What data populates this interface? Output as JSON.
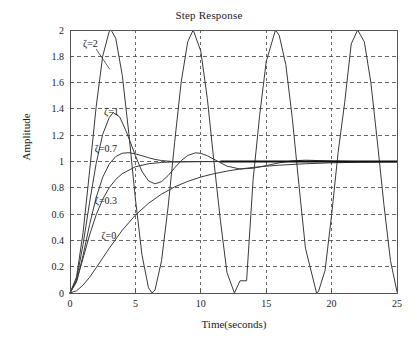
{
  "figure": {
    "title": "Step Response",
    "background_color": "#ffffff",
    "axis_color": "#555555",
    "grid_color": "#444444",
    "curve_color": "#3a3a3a"
  },
  "axes": {
    "x_label": "Time(seconds)",
    "y_label": "Amplitude",
    "x_ticks": [
      "0",
      "5",
      "10",
      "15",
      "20",
      "25"
    ],
    "y_ticks": [
      "0",
      "0.2",
      "0.4",
      "0.6",
      "0.8",
      "1",
      "1.2",
      "1.4",
      "1.6",
      "1.8",
      "2"
    ]
  },
  "annotations": [
    {
      "name": "zeta-2-label",
      "text": "ζ=2",
      "x": 1.0,
      "y": 1.9
    },
    {
      "name": "zeta-1-label",
      "text": "ζ=1",
      "x": 2.6,
      "y": 1.38
    },
    {
      "name": "zeta-0p7-label",
      "text": "ζ=0.7",
      "x": 1.9,
      "y": 1.1
    },
    {
      "name": "zeta-0p3-label",
      "text": "ζ=0.3",
      "x": 1.9,
      "y": 0.7
    },
    {
      "name": "zeta-0-label",
      "text": "ζ=0",
      "x": 2.4,
      "y": 0.44
    }
  ],
  "chart_data": {
    "type": "line",
    "title": "Step Response",
    "xlabel": "Time(seconds)",
    "ylabel": "Amplitude",
    "xlim": [
      0,
      25
    ],
    "ylim": [
      0,
      2
    ],
    "xticks": [
      0,
      5,
      10,
      15,
      20,
      25
    ],
    "yticks": [
      0,
      0.2,
      0.4,
      0.6,
      0.8,
      1,
      1.2,
      1.4,
      1.6,
      1.8,
      2
    ],
    "grid": true,
    "legend": "inline annotations",
    "natural_frequency_rad_per_s": 1,
    "series": [
      {
        "name": "ζ=0",
        "damping_ratio": 0,
        "description": "Undamped: sustained oscillation 1-cos(t), peaks at 2, troughs at 0",
        "x": [
          0,
          0.5,
          1,
          1.5,
          2,
          2.5,
          3,
          3.14,
          3.5,
          4,
          4.5,
          5,
          5.5,
          6,
          6.28,
          6.5,
          7,
          7.5,
          8,
          8.5,
          9,
          9.42,
          10,
          10.5,
          11,
          11.5,
          12,
          12.57,
          13,
          13.5,
          14,
          14.5,
          15,
          15.71,
          16,
          16.5,
          17,
          17.5,
          18,
          18.85,
          19,
          19.5,
          20,
          20.5,
          21,
          21.5,
          21.99,
          22.5,
          23,
          23.5,
          24,
          24.5,
          25
        ],
        "y": [
          0,
          0.122,
          0.46,
          0.929,
          1.416,
          1.801,
          1.99,
          2.0,
          1.936,
          1.654,
          1.211,
          0.716,
          0.291,
          0.04,
          0.0,
          0.023,
          0.246,
          0.654,
          1.145,
          1.604,
          1.911,
          2.0,
          1.839,
          1.478,
          1.004,
          0.551,
          0.156,
          0.0,
          0.093,
          0.093,
          0.863,
          1.351,
          1.759,
          2.0,
          1.958,
          1.736,
          1.325,
          0.825,
          0.341,
          0.0,
          0.012,
          0.172,
          0.592,
          1.07,
          1.448,
          1.894,
          2.0,
          1.911,
          1.602,
          1.149,
          0.673,
          0.247,
          0.009
        ]
      },
      {
        "name": "ζ=0.3",
        "damping_ratio": 0.3,
        "description": "Underdamped: first overshoot ~1.37 near t=3.3, second small overshoot ~1.06 near t=10",
        "x": [
          0,
          0.5,
          1,
          1.5,
          2,
          2.5,
          3,
          3.3,
          3.8,
          4.3,
          5,
          5.5,
          6,
          6.5,
          7,
          7.5,
          8,
          8.5,
          9,
          9.6,
          10,
          10.5,
          11,
          12,
          13,
          14,
          15,
          16,
          17,
          18,
          20,
          22,
          25
        ],
        "y": [
          0,
          0.105,
          0.37,
          0.69,
          0.985,
          1.206,
          1.334,
          1.372,
          1.339,
          1.229,
          1.045,
          0.925,
          0.853,
          0.83,
          0.847,
          0.893,
          0.951,
          1.006,
          1.046,
          1.066,
          1.062,
          1.044,
          1.017,
          0.965,
          0.943,
          0.949,
          0.969,
          0.99,
          1.005,
          1.01,
          1.004,
          0.999,
          1.0
        ]
      },
      {
        "name": "ζ=0.7",
        "damping_ratio": 0.7,
        "description": "Near-critically damped: slight overshoot ~1.05 near t=4.5, settles to 1",
        "x": [
          0,
          0.5,
          1,
          1.5,
          2,
          2.5,
          3,
          3.5,
          4,
          4.5,
          5,
          5.5,
          6,
          6.5,
          7,
          8,
          9,
          10,
          12,
          14,
          16,
          18,
          20,
          22,
          25
        ],
        "y": [
          0,
          0.085,
          0.287,
          0.521,
          0.726,
          0.88,
          0.981,
          1.038,
          1.063,
          1.067,
          1.058,
          1.044,
          1.029,
          1.016,
          1.007,
          0.998,
          0.998,
          0.999,
          1.0,
          1.0,
          1.0,
          1.0,
          1.0,
          1.0,
          1.0
        ]
      },
      {
        "name": "ζ=1",
        "damping_ratio": 1,
        "description": "Critically damped: monotonic rise 1-(1+t)e^-t, no overshoot",
        "x": [
          0,
          0.5,
          1,
          1.5,
          2,
          2.5,
          3,
          3.5,
          4,
          5,
          6,
          7,
          8,
          9,
          10,
          12,
          14,
          16,
          18,
          20,
          22,
          25
        ],
        "y": [
          0,
          0.09,
          0.264,
          0.442,
          0.594,
          0.713,
          0.801,
          0.864,
          0.908,
          0.96,
          0.983,
          0.993,
          0.997,
          0.999,
          0.9995,
          1.0,
          1.0,
          1.0,
          1.0,
          1.0,
          1.0,
          1.0
        ]
      },
      {
        "name": "ζ=2",
        "damping_ratio": 2,
        "description": "Overdamped: slow monotonic rise, slowest to settle",
        "x": [
          0,
          0.5,
          1,
          1.5,
          2,
          2.5,
          3,
          4,
          5,
          6,
          7,
          8,
          9,
          10,
          11,
          12,
          13,
          14,
          15,
          16,
          18,
          20,
          22,
          25
        ],
        "y": [
          0,
          0.017,
          0.06,
          0.12,
          0.191,
          0.266,
          0.34,
          0.478,
          0.592,
          0.682,
          0.752,
          0.807,
          0.849,
          0.882,
          0.907,
          0.927,
          0.943,
          0.955,
          0.964,
          0.972,
          0.983,
          0.99,
          0.994,
          0.997
        ]
      }
    ]
  }
}
